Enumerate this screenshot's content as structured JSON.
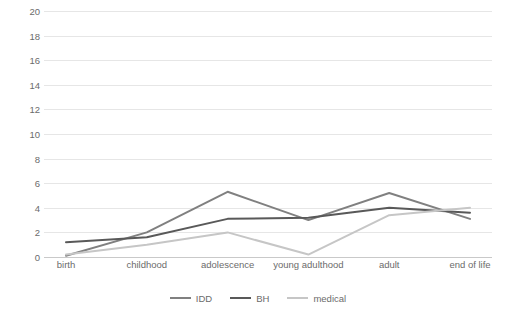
{
  "chart_data": {
    "type": "line",
    "title": "",
    "xlabel": "",
    "ylabel": "",
    "categories": [
      "birth",
      "childhood",
      "adolescence",
      "young adulthood",
      "adult",
      "end of life"
    ],
    "yticks": [
      "0",
      "2",
      "4",
      "6",
      "8",
      "10",
      "12",
      "14",
      "16",
      "18",
      "20"
    ],
    "ylim": [
      0,
      20
    ],
    "grid": true,
    "legend_position": "bottom",
    "series": [
      {
        "name": "IDD",
        "color": "#808080",
        "values": [
          0.1,
          2.0,
          5.3,
          3.0,
          5.2,
          3.1
        ]
      },
      {
        "name": "BH",
        "color": "#595959",
        "values": [
          1.2,
          1.6,
          3.1,
          3.2,
          4.0,
          3.6
        ]
      },
      {
        "name": "medical",
        "color": "#c6c6c6",
        "values": [
          0.2,
          1.0,
          2.0,
          0.2,
          3.4,
          4.0
        ]
      }
    ]
  }
}
